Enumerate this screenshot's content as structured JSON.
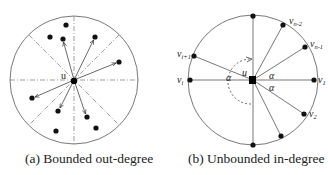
{
  "panels": [
    {
      "id": "a",
      "caption": "(a) Bounded out-degree",
      "center_label": "u",
      "circle": {
        "cx": 74,
        "cy": 80,
        "r": 64
      },
      "sector_lines": "dash-dot lines dividing the disk into 8 sectors",
      "nodes": [
        {
          "x": 66,
          "y": 25,
          "arrow": false
        },
        {
          "x": 50,
          "y": 37,
          "arrow": false
        },
        {
          "x": 63,
          "y": 39,
          "arrow": true
        },
        {
          "x": 95,
          "y": 37,
          "arrow": true
        },
        {
          "x": 119,
          "y": 62,
          "arrow": true
        },
        {
          "x": 32,
          "y": 98,
          "arrow": true
        },
        {
          "x": 58,
          "y": 111,
          "arrow": true
        },
        {
          "x": 87,
          "y": 117,
          "arrow": true
        },
        {
          "x": 96,
          "y": 128,
          "arrow": false
        },
        {
          "x": 56,
          "y": 131,
          "arrow": false
        }
      ]
    },
    {
      "id": "b",
      "caption": "(b) Unbounded in-degree",
      "center_label": "u",
      "angle_label": "α",
      "circle": {
        "cx": 253,
        "cy": 80,
        "r": 65
      },
      "nodes": [
        {
          "x": 253,
          "y": 16,
          "label": ""
        },
        {
          "x": 283,
          "y": 25,
          "label": "v",
          "sub": "n-2"
        },
        {
          "x": 305,
          "y": 47,
          "label": "v",
          "sub": "n-1"
        },
        {
          "x": 314,
          "y": 80,
          "label": "v",
          "sub": "1"
        },
        {
          "x": 304,
          "y": 114,
          "label": "v",
          "sub": "2"
        },
        {
          "x": 281,
          "y": 136,
          "label": ""
        },
        {
          "x": 253,
          "y": 145,
          "label": ""
        },
        {
          "x": 190,
          "y": 80,
          "label": "v",
          "sub": "i"
        },
        {
          "x": 194,
          "y": 56,
          "label": "v",
          "sub": "i+1"
        }
      ]
    }
  ]
}
